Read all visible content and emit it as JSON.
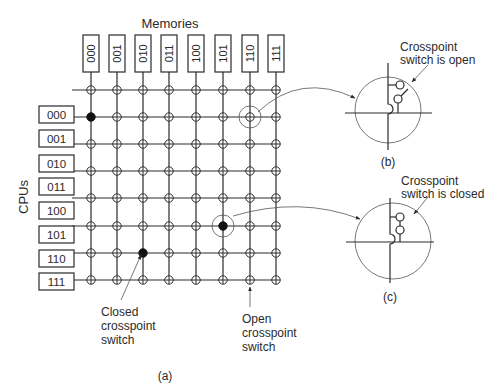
{
  "title": "Memories",
  "cpu_axis_label": "CPUs",
  "memories": [
    "000",
    "001",
    "010",
    "011",
    "100",
    "101",
    "110",
    "111"
  ],
  "cpus": [
    "000",
    "001",
    "010",
    "011",
    "100",
    "101",
    "110",
    "111"
  ],
  "closed_switches": [
    [
      0,
      1
    ],
    [
      2,
      6
    ],
    [
      5,
      5
    ]
  ],
  "annotations": {
    "closed_label": [
      "Closed",
      "crosspoint",
      "switch"
    ],
    "open_label": [
      "Open",
      "crosspoint",
      "switch"
    ],
    "detail_open_label": [
      "Crosspoint",
      "switch is open"
    ],
    "detail_closed_label": [
      "Crosspoint",
      "switch is closed"
    ]
  },
  "captions": {
    "a": "(a)",
    "b": "(b)",
    "c": "(c)"
  },
  "colors": {
    "line": "#2a2a2a",
    "thin": "#555555"
  }
}
